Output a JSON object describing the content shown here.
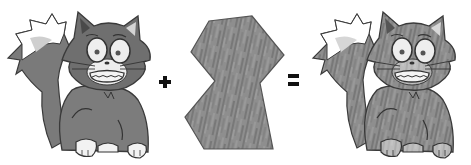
{
  "diagram": {
    "description": "Cat drawing + fur texture patch = textured cat",
    "operands": [
      {
        "id": "cat",
        "label": "Cartoon cat (untextured)"
      },
      {
        "id": "texture",
        "label": "Fur texture patch"
      },
      {
        "id": "result",
        "label": "Textured cartoon cat"
      }
    ],
    "operators": {
      "plus": "+",
      "equals": "="
    }
  },
  "colors": {
    "background": "#ffffff",
    "fur_dark": "#6e6e6e",
    "fur_mid": "#8a8a8a",
    "outline": "#3a3a3a",
    "white_parts": "#f2f2f2",
    "inner_ear": "#d0d0d0",
    "tail_tip_light": "#c8c8c8",
    "texture_base": "#8c8c8c",
    "texture_streak": "#6a6a6a",
    "operator": "#111111"
  }
}
